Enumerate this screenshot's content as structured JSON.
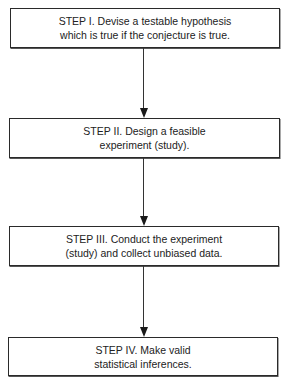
{
  "diagram": {
    "type": "flowchart",
    "direction": "top-to-bottom",
    "colors": {
      "border": "#2a2a2a",
      "text": "#222222",
      "arrow": "#1a1a1a",
      "background": "#ffffff"
    },
    "steps": [
      {
        "id": "step-1",
        "lines": [
          "STEP I. Devise a testable hypothesis",
          "which is true if the conjecture is true."
        ]
      },
      {
        "id": "step-2",
        "lines": [
          "STEP II. Design a feasible",
          "experiment (study)."
        ]
      },
      {
        "id": "step-3",
        "lines": [
          "STEP III. Conduct the experiment",
          "(study) and collect unbiased data."
        ]
      },
      {
        "id": "step-4",
        "lines": [
          "STEP IV. Make valid",
          "statistical inferences."
        ]
      }
    ],
    "edges": [
      {
        "from": "step-1",
        "to": "step-2"
      },
      {
        "from": "step-2",
        "to": "step-3"
      },
      {
        "from": "step-3",
        "to": "step-4"
      }
    ]
  }
}
